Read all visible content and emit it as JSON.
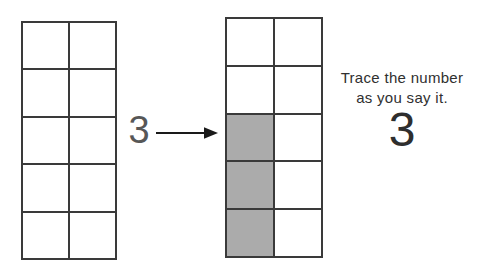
{
  "instruction": {
    "line1": "Trace the number",
    "line2": "as you say it."
  },
  "cue": {
    "number": "3"
  },
  "trace": {
    "number": "3"
  },
  "frames": {
    "left": {
      "columns": 2,
      "rows": 5,
      "shaded_count": 0,
      "shaded_indices": []
    },
    "right": {
      "columns": 2,
      "rows": 5,
      "shaded_count": 3,
      "shaded_indices": [
        4,
        6,
        8
      ]
    }
  },
  "arrow": {
    "direction": "right"
  },
  "colors": {
    "background": "#ffffff",
    "grid_line": "#3a3a3a",
    "shaded_cell": "#ababab",
    "arrow": "#1a1a1a",
    "text": "#303030"
  }
}
